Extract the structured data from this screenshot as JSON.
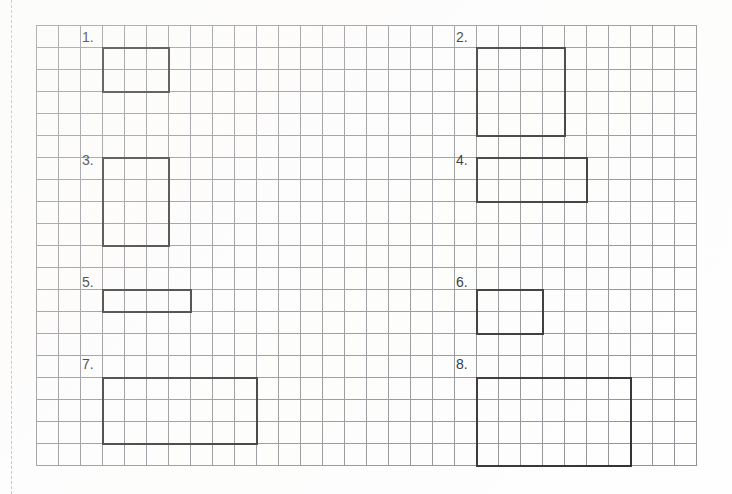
{
  "page": {
    "kind": "grid-worksheet",
    "background_color": "#fefefe",
    "margin_line_color": "#c8b9ae"
  },
  "grid": {
    "origin_x": 36,
    "origin_y": 25,
    "cell_size": 22,
    "columns": 30,
    "rows": 20,
    "line_color": "#8e9095",
    "line_width": 1
  },
  "shape_style": {
    "stroke_color": "#2b2b2b",
    "stroke_width": 2,
    "fill": "none"
  },
  "items": [
    {
      "label": "1.",
      "label_x": 82,
      "label_y": 30,
      "col": 3,
      "row": 1,
      "width_cells": 3,
      "height_cells": 2
    },
    {
      "label": "2.",
      "label_x": 456,
      "label_y": 30,
      "col": 20,
      "row": 1,
      "width_cells": 4,
      "height_cells": 4
    },
    {
      "label": "3.",
      "label_x": 82,
      "label_y": 153,
      "col": 3,
      "row": 6,
      "width_cells": 3,
      "height_cells": 4
    },
    {
      "label": "4.",
      "label_x": 456,
      "label_y": 153,
      "col": 20,
      "row": 6,
      "width_cells": 5,
      "height_cells": 2
    },
    {
      "label": "5.",
      "label_x": 82,
      "label_y": 275,
      "col": 3,
      "row": 12,
      "width_cells": 4,
      "height_cells": 1
    },
    {
      "label": "6.",
      "label_x": 456,
      "label_y": 275,
      "col": 20,
      "row": 12,
      "width_cells": 3,
      "height_cells": 2
    },
    {
      "label": "7.",
      "label_x": 82,
      "label_y": 357,
      "col": 3,
      "row": 16,
      "width_cells": 7,
      "height_cells": 3
    },
    {
      "label": "8.",
      "label_x": 456,
      "label_y": 357,
      "col": 20,
      "row": 16,
      "width_cells": 7,
      "height_cells": 4
    }
  ]
}
